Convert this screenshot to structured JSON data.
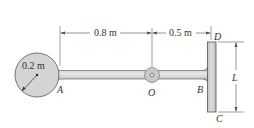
{
  "diagram": {
    "type": "mechanics-figure",
    "labels": {
      "radius": "0.2 m",
      "dim_AO": "0.8 m",
      "dim_OB": "0.5 m",
      "length": "L",
      "point_A": "A",
      "point_O": "O",
      "point_B": "B",
      "point_C": "C",
      "point_D": "D"
    },
    "colors": {
      "body_fill": "#d4d4d4",
      "body_stroke": "#555555",
      "dimension_line": "#666666",
      "text": "#333333"
    }
  }
}
